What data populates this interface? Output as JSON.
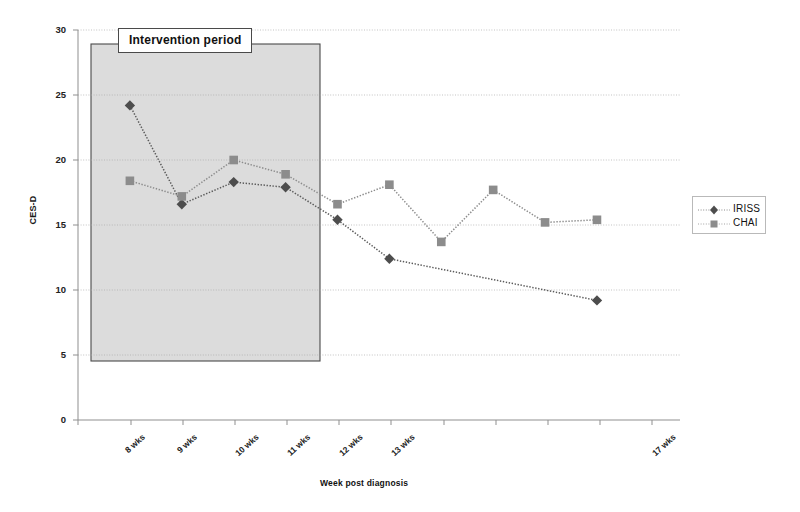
{
  "chart_data": {
    "type": "line",
    "title": "",
    "xlabel": "Week post diagnosis",
    "ylabel": "CES-D",
    "ylim": [
      0,
      30
    ],
    "yticks": [
      0,
      5,
      10,
      15,
      20,
      25,
      30
    ],
    "grid": true,
    "categories": [
      "8 wks",
      "9 wks",
      "10 wks",
      "11 wks",
      "12 wks",
      "13 wks",
      "",
      "",
      "",
      "17 wks"
    ],
    "series": [
      {
        "name": "IRISS",
        "marker": "diamond",
        "color": "#5a5a5a",
        "values": [
          24.2,
          16.6,
          18.3,
          17.9,
          15.4,
          12.4,
          null,
          null,
          null,
          9.2
        ]
      },
      {
        "name": "CHAI",
        "marker": "square",
        "color": "#8c8c8c",
        "values": [
          18.4,
          17.2,
          20.0,
          18.9,
          16.6,
          18.1,
          13.7,
          17.7,
          15.2,
          15.4
        ]
      }
    ],
    "annotations": [
      {
        "name": "intervention-period",
        "label": "Intervention period",
        "from": "8 wks",
        "to": "11 wks"
      }
    ],
    "legend_position": "right"
  },
  "axes": {
    "y_title": "CES-D",
    "x_title": "Week post diagnosis",
    "y_tick_labels": [
      "30",
      "25",
      "20",
      "15",
      "10",
      "5",
      "0"
    ],
    "x_tick_labels": [
      "8 wks",
      "9 wks",
      "10 wks",
      "11 wks",
      "12 wks",
      "13 wks",
      "17 wks"
    ]
  },
  "annotation": {
    "intervention_label": "Intervention period"
  },
  "legend": {
    "items": [
      {
        "label": "IRISS",
        "marker": "diamond"
      },
      {
        "label": "CHAI",
        "marker": "square"
      }
    ]
  },
  "colors": {
    "iriss": "#5a5a5a",
    "chai": "#8c8c8c",
    "shaded_region": "#dcdcdc",
    "gridline": "#a9a9a9",
    "axis": "#9a9a9a"
  }
}
